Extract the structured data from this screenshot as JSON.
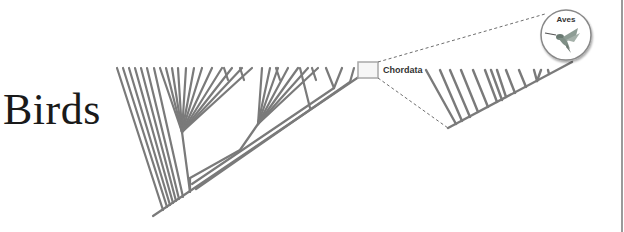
{
  "title": "Birds",
  "diagram": {
    "type": "phylogenetic-tree-zoom",
    "zoom_box_label": "Chordata",
    "callout_label": "Aves",
    "callout_icon": "hummingbird-icon",
    "colors": {
      "branch": "#7a7a7a",
      "dashed": "#6e6e6e",
      "box": "#a8a8a8",
      "text": "#1a1a1a",
      "circle": "#888888"
    }
  }
}
